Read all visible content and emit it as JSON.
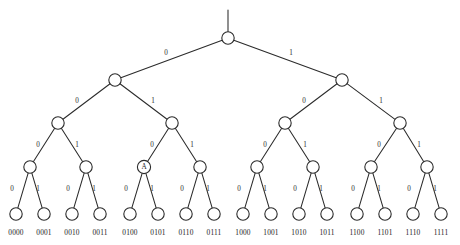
{
  "figure": {
    "type": "binary-tree-diagram",
    "background_color": "#ffffff",
    "stroke_color": "#2b2b2b",
    "text_color": "#1d1d1d",
    "depth": 4,
    "leaf_count": 16,
    "edge_label_left": "0",
    "edge_label_right": "1",
    "marked_node_label": "A"
  },
  "tree": {
    "root": {
      "id": "root",
      "cx": 228,
      "cy": 38,
      "r": 6.2,
      "label": "",
      "level": 0
    },
    "stem": {
      "x1": 228,
      "y1": 10,
      "x2": 228,
      "y2": 32
    },
    "levels": [
      {
        "level": 1,
        "node_y": 80,
        "nodes": [
          {
            "id": "n0",
            "cx": 115,
            "cy": 80,
            "r": 6.2,
            "label": ""
          },
          {
            "id": "n1",
            "cx": 342,
            "cy": 80,
            "r": 6.2,
            "label": ""
          }
        ],
        "edge_labels": [
          {
            "text": "0",
            "x": 166,
            "y": 53
          },
          {
            "text": "1",
            "x": 291,
            "y": 53
          }
        ]
      },
      {
        "level": 2,
        "node_y": 123,
        "nodes": [
          {
            "id": "n00",
            "cx": 58,
            "cy": 123,
            "r": 6.2,
            "label": ""
          },
          {
            "id": "n01",
            "cx": 172,
            "cy": 123,
            "r": 6.2,
            "label": ""
          },
          {
            "id": "n10",
            "cx": 285,
            "cy": 123,
            "r": 6.2,
            "label": ""
          },
          {
            "id": "n11",
            "cx": 400,
            "cy": 123,
            "r": 6.2,
            "label": ""
          }
        ],
        "edge_labels": [
          {
            "text": "0",
            "x": 77,
            "y": 101
          },
          {
            "text": "1",
            "x": 153,
            "y": 101
          },
          {
            "text": "0",
            "x": 304,
            "y": 101
          },
          {
            "text": "1",
            "x": 381,
            "y": 101
          }
        ]
      },
      {
        "level": 3,
        "node_y": 167,
        "nodes": [
          {
            "id": "n000",
            "cx": 30,
            "cy": 167,
            "r": 6.2,
            "label": ""
          },
          {
            "id": "n001",
            "cx": 86,
            "cy": 167,
            "r": 6.2,
            "label": ""
          },
          {
            "id": "n010",
            "cx": 144,
            "cy": 167,
            "r": 6.6,
            "label": "A"
          },
          {
            "id": "n011",
            "cx": 200,
            "cy": 167,
            "r": 6.2,
            "label": ""
          },
          {
            "id": "n100",
            "cx": 257,
            "cy": 167,
            "r": 6.2,
            "label": ""
          },
          {
            "id": "n101",
            "cx": 313,
            "cy": 167,
            "r": 6.2,
            "label": ""
          },
          {
            "id": "n110",
            "cx": 371,
            "cy": 167,
            "r": 6.2,
            "label": ""
          },
          {
            "id": "n111",
            "cx": 427,
            "cy": 167,
            "r": 6.2,
            "label": ""
          }
        ],
        "edge_labels": [
          {
            "text": "0",
            "x": 38,
            "y": 145
          },
          {
            "text": "1",
            "x": 77,
            "y": 145
          },
          {
            "text": "0",
            "x": 152,
            "y": 145
          },
          {
            "text": "1",
            "x": 192,
            "y": 145
          },
          {
            "text": "0",
            "x": 265,
            "y": 145
          },
          {
            "text": "1",
            "x": 305,
            "y": 145
          },
          {
            "text": "0",
            "x": 379,
            "y": 145
          },
          {
            "text": "1",
            "x": 419,
            "y": 145
          }
        ]
      },
      {
        "level": 4,
        "node_y": 214,
        "nodes": [
          {
            "id": "l0",
            "cx": 16,
            "cy": 214,
            "r": 6.2,
            "label": ""
          },
          {
            "id": "l1",
            "cx": 44,
            "cy": 214,
            "r": 6.2,
            "label": ""
          },
          {
            "id": "l2",
            "cx": 72,
            "cy": 214,
            "r": 6.2,
            "label": ""
          },
          {
            "id": "l3",
            "cx": 100,
            "cy": 214,
            "r": 6.2,
            "label": ""
          },
          {
            "id": "l4",
            "cx": 130,
            "cy": 214,
            "r": 6.2,
            "label": ""
          },
          {
            "id": "l5",
            "cx": 158,
            "cy": 214,
            "r": 6.2,
            "label": ""
          },
          {
            "id": "l6",
            "cx": 186,
            "cy": 214,
            "r": 6.2,
            "label": ""
          },
          {
            "id": "l7",
            "cx": 214,
            "cy": 214,
            "r": 6.2,
            "label": ""
          },
          {
            "id": "l8",
            "cx": 243,
            "cy": 214,
            "r": 6.2,
            "label": ""
          },
          {
            "id": "l9",
            "cx": 271,
            "cy": 214,
            "r": 6.2,
            "label": ""
          },
          {
            "id": "l10",
            "cx": 299,
            "cy": 214,
            "r": 6.2,
            "label": ""
          },
          {
            "id": "l11",
            "cx": 327,
            "cy": 214,
            "r": 6.2,
            "label": ""
          },
          {
            "id": "l12",
            "cx": 357,
            "cy": 214,
            "r": 6.2,
            "label": ""
          },
          {
            "id": "l13",
            "cx": 385,
            "cy": 214,
            "r": 6.2,
            "label": ""
          },
          {
            "id": "l14",
            "cx": 413,
            "cy": 214,
            "r": 6.2,
            "label": ""
          },
          {
            "id": "l15",
            "cx": 441,
            "cy": 214,
            "r": 6.2,
            "label": ""
          }
        ],
        "edge_labels": [
          {
            "text": "0",
            "x": 12,
            "y": 189
          },
          {
            "text": "1",
            "x": 38,
            "y": 189
          },
          {
            "text": "0",
            "x": 68,
            "y": 189
          },
          {
            "text": "1",
            "x": 94,
            "y": 189
          },
          {
            "text": "0",
            "x": 126,
            "y": 189
          },
          {
            "text": "1",
            "x": 152,
            "y": 189
          },
          {
            "text": "0",
            "x": 182,
            "y": 189
          },
          {
            "text": "1",
            "x": 208,
            "y": 189
          },
          {
            "text": "0",
            "x": 239,
            "y": 189
          },
          {
            "text": "1",
            "x": 265,
            "y": 189
          },
          {
            "text": "0",
            "x": 295,
            "y": 189
          },
          {
            "text": "1",
            "x": 321,
            "y": 189
          },
          {
            "text": "0",
            "x": 353,
            "y": 189
          },
          {
            "text": "1",
            "x": 379,
            "y": 189
          },
          {
            "text": "0",
            "x": 409,
            "y": 189
          },
          {
            "text": "1",
            "x": 435,
            "y": 189
          }
        ]
      }
    ],
    "leaf_labels": [
      {
        "text": "0000",
        "x": 16,
        "y": 233
      },
      {
        "text": "0001",
        "x": 44,
        "y": 233
      },
      {
        "text": "0010",
        "x": 72,
        "y": 233
      },
      {
        "text": "0011",
        "x": 100,
        "y": 233
      },
      {
        "text": "0100",
        "x": 130,
        "y": 233
      },
      {
        "text": "0101",
        "x": 158,
        "y": 233
      },
      {
        "text": "0110",
        "x": 186,
        "y": 233
      },
      {
        "text": "0111",
        "x": 214,
        "y": 233
      },
      {
        "text": "1000",
        "x": 243,
        "y": 233
      },
      {
        "text": "1001",
        "x": 271,
        "y": 233
      },
      {
        "text": "1010",
        "x": 299,
        "y": 233
      },
      {
        "text": "1011",
        "x": 327,
        "y": 233
      },
      {
        "text": "1100",
        "x": 357,
        "y": 233
      },
      {
        "text": "1101",
        "x": 385,
        "y": 233
      },
      {
        "text": "1110",
        "x": 413,
        "y": 233
      },
      {
        "text": "1111",
        "x": 441,
        "y": 233
      }
    ]
  }
}
